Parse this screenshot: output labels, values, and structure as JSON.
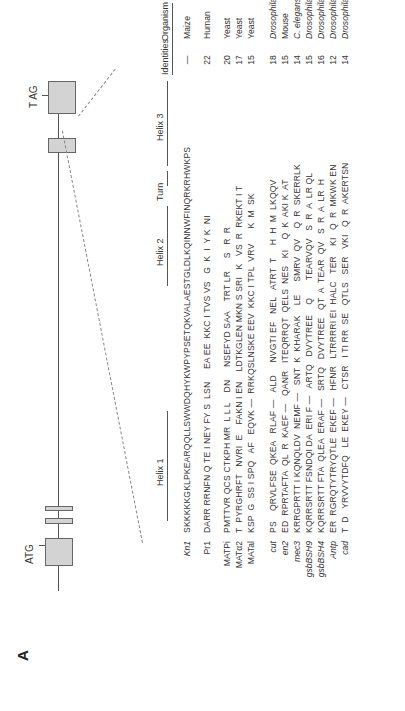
{
  "figure": {
    "panel": "A",
    "gene_diagram": {
      "start_codon": "ATG",
      "stop_codon": "T AG"
    },
    "headers": {
      "helix1": "Helix 1",
      "helix2": "Helix 2",
      "turn": "Turn",
      "helix3": "Helix 3",
      "identities": "Identities",
      "organism": "Organism"
    },
    "rows": [
      {
        "name": "Kn1",
        "italic": true,
        "seq": "SKKKKKGKLPKEARQQLLSWWDQHYKWPYPSETQKVALAESTGLDLKQINNWFINQRKRHWKPS",
        "identities": "—",
        "organism": "Maize",
        "org_italic": false
      },
      {
        "name": "Pr1",
        "italic": false,
        "seq": "DARR RRNFN Q TE I NEY FY S  LSN     EA EE  KKC I TVS VS   G  K  I  Y K  NI",
        "identities": "22",
        "organism": "Human",
        "org_italic": false
      },
      {
        "name": "MATPi",
        "italic": false,
        "seq": "PMTTVR QCS CTKPH MR  L L L    DN     NSEFYD SAA    TRT LR     S   R  R",
        "identities": "20",
        "organism": "Yeast",
        "org_italic": false
      },
      {
        "name": "MATα2",
        "italic": false,
        "seq": "T  PYRGHRFT   NVRI  E    FAKN I EN    LDTKGLEN MKN S SRI   K   VS  R  RKEKT I T",
        "identities": "17",
        "organism": "Yeast",
        "org_italic": false
      },
      {
        "name": "MATal",
        "italic": false,
        "seq": "KSP  G  SS I SPQ   AF   EQVK —  RRKQSLNSKE EEV  KKC I TPL  VRV      K  M  SK",
        "identities": "15",
        "organism": "Yeast",
        "org_italic": false
      },
      {
        "name": "cut",
        "italic": true,
        "seq": "PS    QRVLFSE  QKEA   RLAF —   ALD     NVGTI EF   NEL   ATRT  T     H  H  M  LKQQV",
        "identities": "18",
        "organism": "Drosophila",
        "org_italic": true
      },
      {
        "name": "en2",
        "italic": true,
        "seq": "ED  RPRTAFTA  QL  R  KAEF —   QANR   ITEQRRQT  QELS  NES   KI    Q  K  AKI K  AT",
        "identities": "15",
        "organism": "Mouse",
        "org_italic": false
      },
      {
        "name": "mec3",
        "italic": true,
        "seq": "KRRGPRTT I KQNQLDV  NEMF —   SNT  K  KHARAK    LE     SMRV  QV    Q  R  SKERRLK",
        "identities": "14",
        "organism": "C. elegans",
        "org_italic": true
      },
      {
        "name": "gsbBSH9",
        "italic": true,
        "seq": "KQRRSRTT FSNDQI DA  ERI F —   ARTQ   DVYTREE    Q       TEARVQV   S  R  A  LR QL",
        "identities": "15",
        "organism": "Drosophila",
        "org_italic": true
      },
      {
        "name": "gsbBSH4",
        "italic": true,
        "seq": "KQRRSRTT FTA  QLEA  ERAF —   SRTQ   DVYTREE   QT  A  TEAR  QV   S  R  A  LR  H",
        "identities": "16",
        "organism": "Drosophila",
        "org_italic": true
      },
      {
        "name": "Antp",
        "italic": true,
        "seq": "ER  RGRQTYTRYQTLE  EKEF —   HFNR   LTRRRRI EI  HALC   TER    KI   Q  R  MKWK EN",
        "identities": "12",
        "organism": "Drosophila",
        "org_italic": true
      },
      {
        "name": "cad",
        "italic": true,
        "seq": "T  D   YRVVYTDFQ   LE  EKEY —   CTSR   I TI RR  SE   QTLS   SER   VKI   Q  R  AKERTSN",
        "identities": "14",
        "organism": "Drosophila",
        "org_italic": true
      }
    ]
  }
}
